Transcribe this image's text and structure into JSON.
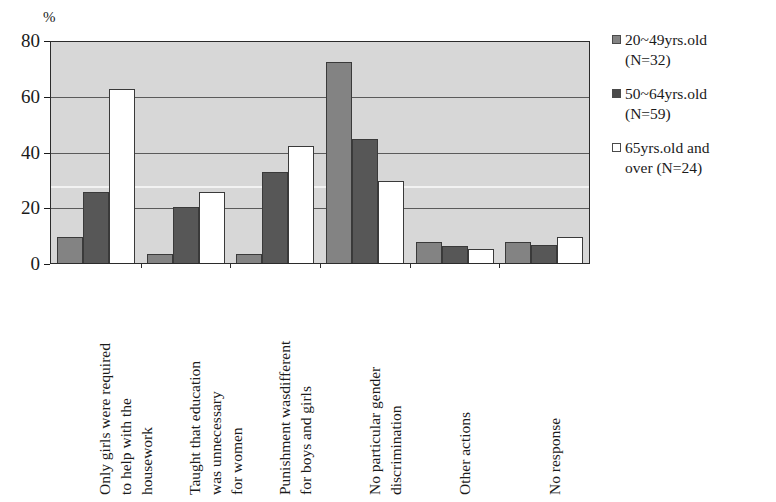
{
  "chart_data": {
    "type": "bar",
    "title": "",
    "subtitle": "",
    "xlabel": "",
    "ylabel": "%",
    "ylim": [
      0,
      80
    ],
    "yticks": [
      0,
      20,
      40,
      60,
      80
    ],
    "grid": true,
    "legend_position": "right",
    "categories": [
      "Only girls were required\nto help with the\nhousework",
      "Taught that education\nwas unnecessary\nfor women",
      "Punishment wasdifferent\nfor boys and girls",
      "No particular gender\ndiscrimination",
      "Other actions",
      "No response"
    ],
    "series": [
      {
        "name": "20~49yrs.old\n(N=32)",
        "color": "#838383",
        "values": [
          9.4,
          3.4,
          3.4,
          72.0,
          7.5,
          7.5
        ]
      },
      {
        "name": "50~64yrs.old\n(N=59)",
        "color": "#575757",
        "values": [
          25.4,
          20.0,
          32.8,
          44.5,
          6.0,
          6.5
        ]
      },
      {
        "name": "65yrs.old and\nover (N=24)",
        "color": "#ffffff",
        "values": [
          62.5,
          25.3,
          42.0,
          29.5,
          5.0,
          9.5
        ]
      }
    ]
  },
  "axis": {
    "unit_label": "%",
    "tick_labels": [
      "80",
      "60",
      "40",
      "20",
      "0"
    ]
  },
  "legend": {
    "entries": [
      {
        "label": "20~49yrs.old\n(N=32)",
        "swatch": "square-filled-gray-icon"
      },
      {
        "label": "50~64yrs.old\n(N=59)",
        "swatch": "square-filled-dark-icon"
      },
      {
        "label": "65yrs.old and\nover (N=24)",
        "swatch": "square-outline-white-icon"
      }
    ]
  }
}
